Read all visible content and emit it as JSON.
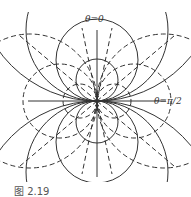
{
  "figure": {
    "caption": "图 2.19",
    "labels": {
      "theta_zero": "θ=0",
      "theta_half_pi": "θ=π/2"
    }
  },
  "style": {
    "line_color": "#333333",
    "background": "#ffffff"
  }
}
